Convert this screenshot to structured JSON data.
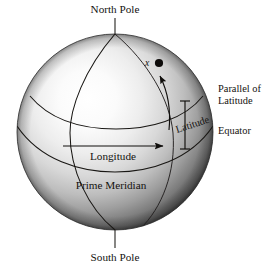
{
  "figure": {
    "type": "geographic-coordinate-sphere-diagram",
    "background_color": "#ffffff",
    "ink_color": "#191714",
    "sphere": {
      "center_x": 115,
      "center_y": 132,
      "radius": 98,
      "highlight_color": "#ffffff",
      "midtone_color": "#9a9a9a",
      "shadow_color": "#1d1d1d",
      "highlight_offset_x": 38,
      "highlight_offset_y": 34
    },
    "labels": {
      "north_pole": "North Pole",
      "south_pole": "South Pole",
      "parallel_of_latitude_line1": "Parallel of",
      "parallel_of_latitude_line2": "Latitude",
      "equator": "Equator",
      "latitude": "Latitude",
      "longitude": "Longitude",
      "prime_meridian": "Prime Meridian",
      "point": "x"
    },
    "features": {
      "point_marker": "filled-dot",
      "longitude_arrow_direction": "right",
      "latitude_arrow_direction": "up-along-meridian",
      "latitude_dimension_bracket": "vertical-span-equator-to-parallel",
      "north_pole_leader": "vertical-line",
      "south_pole_leader": "vertical-line"
    }
  }
}
